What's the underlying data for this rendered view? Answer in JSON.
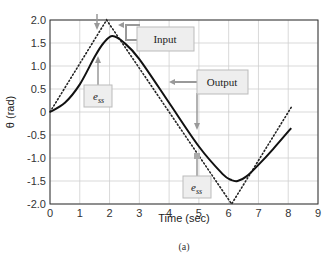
{
  "chart_data": {
    "type": "line",
    "title": "",
    "xlabel": "Time (sec)",
    "ylabel": "θ (rad)",
    "xlim": [
      0,
      9
    ],
    "ylim": [
      -2.0,
      2.0
    ],
    "xticks": [
      "0",
      "1",
      "2",
      "3",
      "4",
      "5",
      "6",
      "7",
      "8",
      "9"
    ],
    "yticks": [
      "2.0",
      "1.5",
      "1.0",
      "0.5",
      "0",
      "-0.5",
      "-1.0",
      "-1.5",
      "-2.0"
    ],
    "grid": true,
    "series": [
      {
        "name": "Input",
        "style": "dotted",
        "x": [
          0,
          1.9,
          6.1,
          8.1
        ],
        "values": [
          0,
          2.0,
          -2.0,
          0.1
        ]
      },
      {
        "name": "Output",
        "style": "solid",
        "x": [
          0,
          0.5,
          1.0,
          1.5,
          1.8,
          2.1,
          2.5,
          3.0,
          4.0,
          5.0,
          5.8,
          6.1,
          6.3,
          6.6,
          7.0,
          7.5,
          8.1
        ],
        "values": [
          0,
          0.2,
          0.6,
          1.2,
          1.5,
          1.65,
          1.5,
          1.15,
          0.2,
          -0.75,
          -1.35,
          -1.48,
          -1.5,
          -1.4,
          -1.15,
          -0.8,
          -0.35
        ]
      }
    ],
    "annotations": [
      {
        "text": "Input",
        "type": "label-box"
      },
      {
        "text": "Output",
        "type": "label-box"
      },
      {
        "text": "e_ss",
        "type": "label-box",
        "near_x": 1.6
      },
      {
        "text": "e_ss",
        "type": "label-box",
        "near_x": 5.0
      }
    ],
    "legend_position": "none",
    "caption": "(a)"
  },
  "labels": {
    "input": "Input",
    "output": "Output",
    "ess_main": "e",
    "ess_sub": "ss",
    "xlabel": "Time (sec)",
    "ylabel": "θ (rad)",
    "caption": "(a)"
  }
}
